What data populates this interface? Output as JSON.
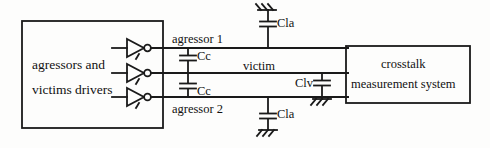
{
  "figure": {
    "type": "circuit-diagram"
  },
  "driver_block": {
    "line1": "agressors and",
    "line2": "victims drivers"
  },
  "nets": {
    "agressor_1": "agressor 1",
    "victim": "victim",
    "agressor_2": "agressor 2"
  },
  "capacitors": {
    "cc_top": "Cc",
    "cc_bottom": "Cc",
    "cla_top": "Cla",
    "cla_bottom": "Cla",
    "clv": "Clv"
  },
  "system_block": {
    "line1": "crosstalk",
    "line2": "measurement system"
  },
  "icons": {
    "inverter_1": "inverter-gate-icon",
    "inverter_2": "inverter-gate-icon",
    "inverter_3": "inverter-gate-icon",
    "ground_cla_top": "ground-icon",
    "ground_cla_bottom": "ground-icon",
    "ground_clv": "ground-icon"
  },
  "colors": {
    "stroke": "#1a1a1a",
    "background": "#fdfdfc",
    "text": "#111111",
    "bleed": "#d8d6d2"
  }
}
